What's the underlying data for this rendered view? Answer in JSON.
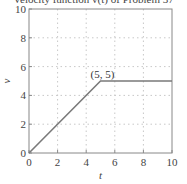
{
  "title": "Velocity function v(t) of Problem 37",
  "colors": {
    "line": "#7a7a7a",
    "axes": "#888888",
    "grid": "#c8c8c8",
    "text": "#444444"
  },
  "chart_data": {
    "type": "line",
    "title": "Velocity function v(t) of Problem 37",
    "xlabel": "t",
    "ylabel": "v",
    "xlim": [
      0,
      10
    ],
    "ylim": [
      0,
      10
    ],
    "xticks": [
      0,
      2,
      4,
      6,
      8,
      10
    ],
    "yticks": [
      0,
      2,
      4,
      6,
      8,
      10
    ],
    "grid": true,
    "series": [
      {
        "name": "v(t)",
        "x": [
          0,
          5,
          10
        ],
        "y": [
          0,
          5,
          5
        ]
      }
    ],
    "annotations": [
      {
        "text": "(5, 5)",
        "x": 5,
        "y": 5
      }
    ]
  }
}
